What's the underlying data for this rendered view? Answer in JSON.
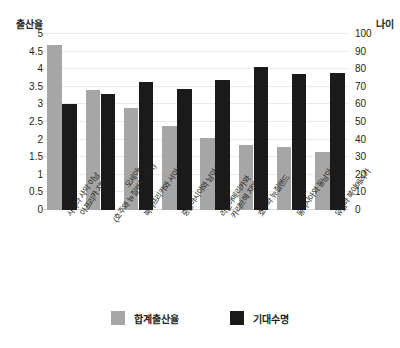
{
  "chart_data": {
    "type": "bar",
    "title": "",
    "categories": [
      "사하라 사막 이남\n아프리카 지역",
      "오세아니아\n(호주와 뉴질랜드 제외)",
      "북아프리카와 서아시아",
      "중앙아시아와 남아시아",
      "라틴아메리카와\n카리브해 지역",
      "호주와 뉴질랜드",
      "동아시아와 동남아시아",
      "유럽과 북아메리카"
    ],
    "series": [
      {
        "name": "합계출산율",
        "axis": "left",
        "color": "#a6a6a6",
        "values": [
          4.7,
          3.4,
          2.9,
          2.4,
          2.05,
          1.85,
          1.8,
          1.65
        ]
      },
      {
        "name": "기대수명",
        "axis": "right",
        "color": "#1a1a1a",
        "values": [
          60,
          66,
          73,
          69,
          74,
          81,
          77,
          78
        ]
      }
    ],
    "xlabel": "",
    "ylabel": "출산율",
    "y2label": "나이",
    "ylim": [
      0,
      5
    ],
    "y2lim": [
      0,
      100
    ],
    "yticks": [
      "0",
      "0.5",
      "1",
      "1.5",
      "2",
      "2.5",
      "3",
      "3.5",
      "4",
      "4.5",
      "5"
    ],
    "y2ticks": [
      "0",
      "10",
      "20",
      "30",
      "40",
      "50",
      "60",
      "70",
      "80",
      "90",
      "100"
    ],
    "grid": true,
    "legend_position": "bottom"
  },
  "axes": {
    "left_title": "출산율",
    "right_title": "나이"
  },
  "legend": {
    "items": [
      {
        "label": "합계출산율",
        "swatch": "gray-swatch-icon"
      },
      {
        "label": "기대수명",
        "swatch": "black-swatch-icon"
      }
    ]
  }
}
